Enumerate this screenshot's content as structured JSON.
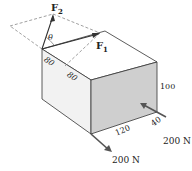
{
  "figure": {
    "forces": {
      "f1": {
        "label": "F",
        "subscript": "1"
      },
      "f2": {
        "label": "F",
        "subscript": "2"
      },
      "angle": "θ"
    },
    "dimensions": {
      "edge_a": "80",
      "edge_b": "80",
      "height": "100",
      "width": "120",
      "depth": "40"
    },
    "loads": {
      "load_right": "200 N",
      "load_bottom": "200 N"
    },
    "colors": {
      "left_face": "#f2f2f2",
      "right_face": "#cfcfcf",
      "top_face": "#ffffff",
      "line": "#333333",
      "dashed": "#777777"
    }
  }
}
